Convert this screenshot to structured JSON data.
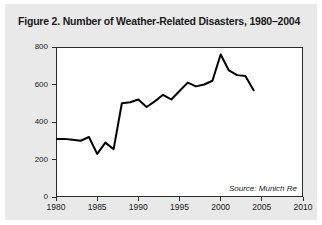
{
  "figure": {
    "title": "Figure 2. Number of Weather-Related Disasters, 1980–2004",
    "source": "Source: Munich Re",
    "panel_color": "#e9e9e9",
    "plot_background": "#ffffff",
    "line_color": "#000000"
  },
  "chart_data": {
    "type": "line",
    "title": "Figure 2. Number of Weather-Related Disasters, 1980–2004",
    "xlabel": "",
    "ylabel": "Number of Events",
    "xlim": [
      1980,
      2010
    ],
    "ylim": [
      0,
      800
    ],
    "xticks": [
      1980,
      1985,
      1990,
      1995,
      2000,
      2005,
      2010
    ],
    "yticks": [
      0,
      200,
      400,
      600,
      800
    ],
    "xtick_labels": [
      "1980",
      "1985",
      "1990",
      "1995",
      "2000",
      "2005",
      "2010"
    ],
    "ytick_labels": [
      "0",
      "200",
      "400",
      "600",
      "800"
    ],
    "grid": false,
    "legend": false,
    "annotations": [
      "Source: Munich Re"
    ],
    "x": [
      1980,
      1981,
      1982,
      1983,
      1984,
      1985,
      1986,
      1987,
      1988,
      1989,
      1990,
      1991,
      1992,
      1993,
      1994,
      1995,
      1996,
      1997,
      1998,
      1999,
      2000,
      2001,
      2002,
      2003,
      2004
    ],
    "values": [
      310,
      310,
      305,
      300,
      320,
      230,
      290,
      255,
      500,
      505,
      520,
      480,
      510,
      545,
      520,
      565,
      610,
      590,
      600,
      620,
      760,
      675,
      650,
      645,
      570
    ],
    "series": [
      {
        "name": "Number of Events",
        "values": [
          310,
          310,
          305,
          300,
          320,
          230,
          290,
          255,
          500,
          505,
          520,
          480,
          510,
          545,
          520,
          565,
          610,
          590,
          600,
          620,
          760,
          675,
          650,
          645,
          570
        ]
      }
    ]
  },
  "axes": {
    "y_title": "Number of Events"
  }
}
